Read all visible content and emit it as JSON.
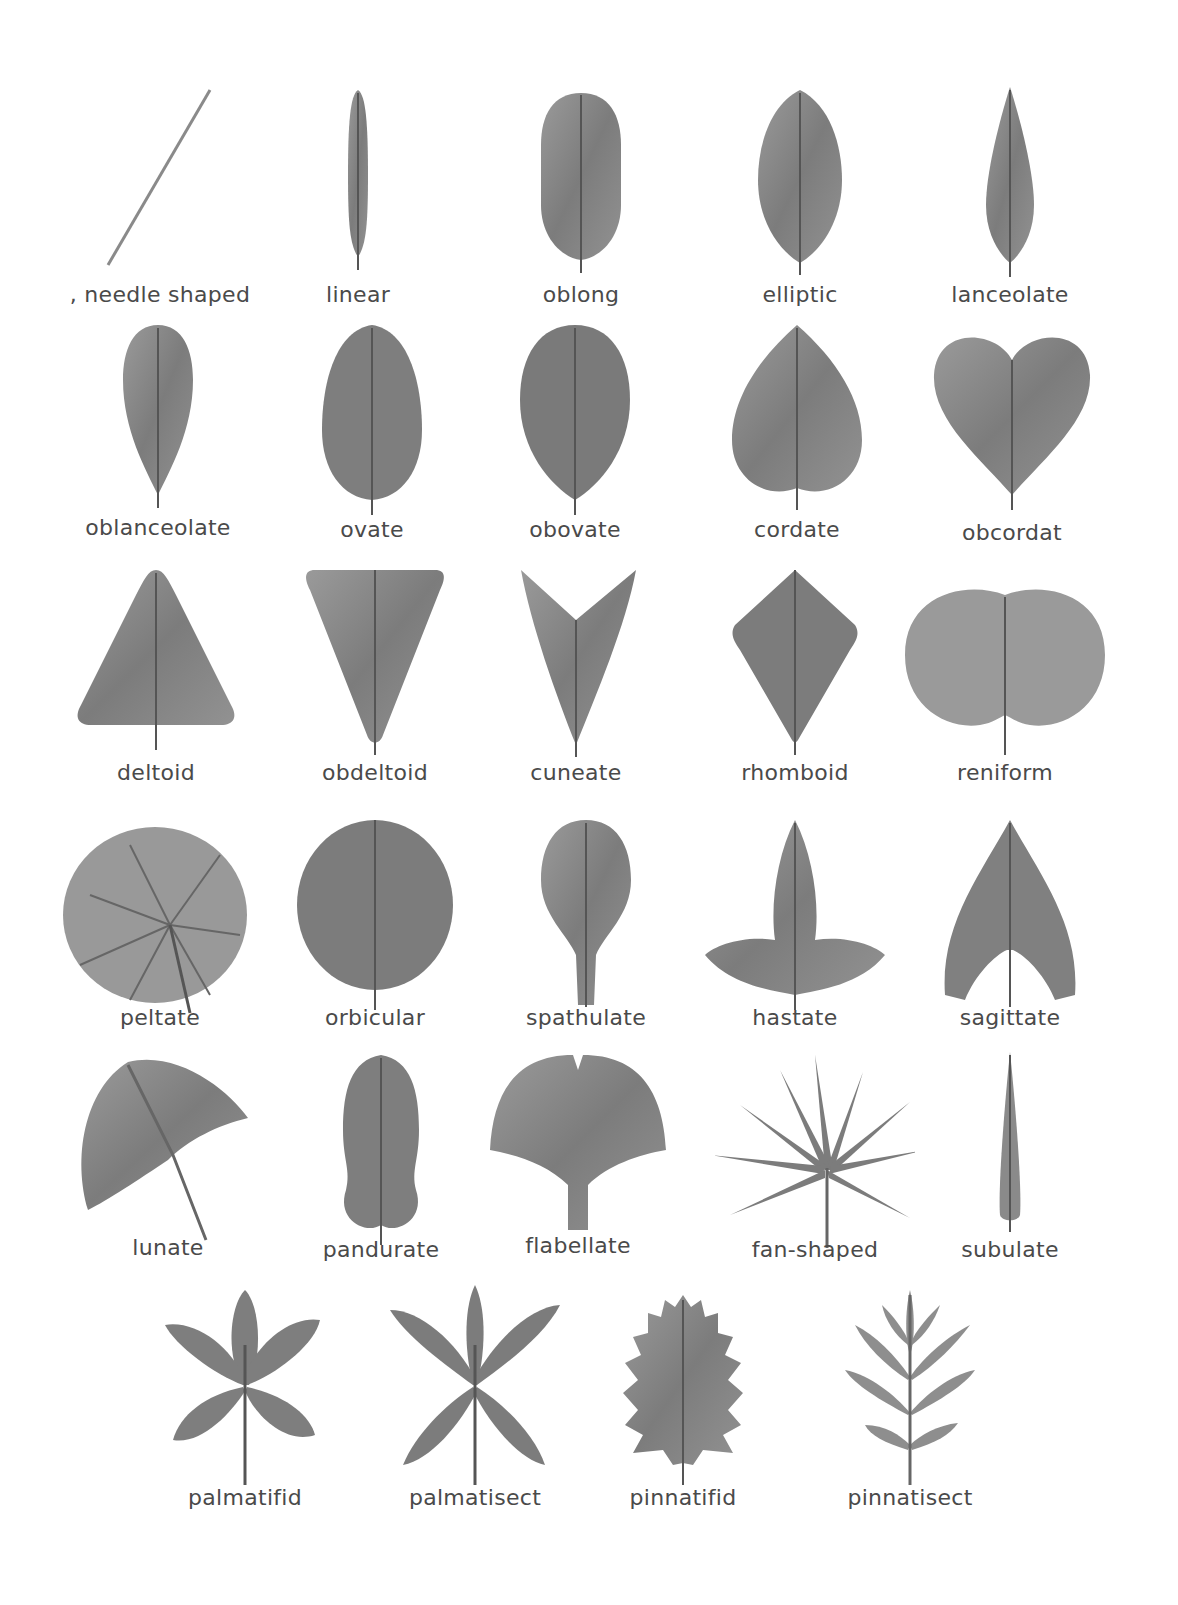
{
  "diagram": {
    "type": "leaf-shape-chart",
    "colors": {
      "leaf_fill": "#8a8a8a",
      "leaf_dark": "#6a6a6a",
      "vein": "#555555",
      "label": "#4a4a4a",
      "background": "#ffffff"
    },
    "rows": [
      {
        "items": [
          {
            "id": "needle",
            "label": ", needle shaped"
          },
          {
            "id": "linear",
            "label": "linear"
          },
          {
            "id": "oblong",
            "label": "oblong"
          },
          {
            "id": "elliptic",
            "label": "elliptic"
          },
          {
            "id": "lanceolate",
            "label": "lanceolate"
          }
        ]
      },
      {
        "items": [
          {
            "id": "oblanceolate",
            "label": "oblanceolate"
          },
          {
            "id": "ovate",
            "label": "ovate"
          },
          {
            "id": "obovate",
            "label": "obovate"
          },
          {
            "id": "cordate",
            "label": "cordate"
          },
          {
            "id": "obcordat",
            "label": "obcordat"
          }
        ]
      },
      {
        "items": [
          {
            "id": "deltoid",
            "label": "deltoid"
          },
          {
            "id": "obdeltoid",
            "label": "obdeltoid"
          },
          {
            "id": "cuneate",
            "label": "cuneate"
          },
          {
            "id": "rhomboid",
            "label": "rhomboid"
          },
          {
            "id": "reniform",
            "label": "reniform"
          }
        ]
      },
      {
        "items": [
          {
            "id": "peltate",
            "label": "peltate"
          },
          {
            "id": "orbicular",
            "label": "orbicular"
          },
          {
            "id": "spathulate",
            "label": "spathulate"
          },
          {
            "id": "hastate",
            "label": "hastate"
          },
          {
            "id": "sagittate",
            "label": "sagittate"
          }
        ]
      },
      {
        "items": [
          {
            "id": "lunate",
            "label": "lunate"
          },
          {
            "id": "pandurate",
            "label": "pandurate"
          },
          {
            "id": "flabellate",
            "label": "flabellate"
          },
          {
            "id": "fan-shaped",
            "label": "fan-shaped"
          },
          {
            "id": "subulate",
            "label": "subulate"
          }
        ]
      },
      {
        "items": [
          {
            "id": "palmatifid",
            "label": "palmatifid"
          },
          {
            "id": "palmatisect",
            "label": "palmatisect"
          },
          {
            "id": "pinnatifid",
            "label": "pinnatifid"
          },
          {
            "id": "pinnatisect",
            "label": "pinnatisect"
          }
        ]
      }
    ]
  }
}
